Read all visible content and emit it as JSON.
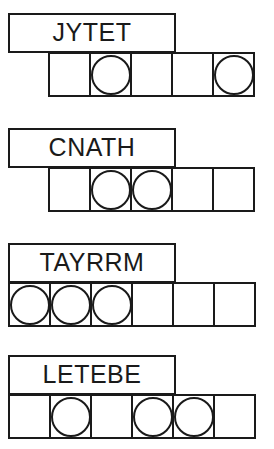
{
  "diagram": {
    "ink_color": "#1a1a1a",
    "paper_color": "#ffffff",
    "stroke_width_px": 2,
    "rows": [
      {
        "label": "JYTET",
        "letter_count": 5,
        "cell_count": 5,
        "strip_left_px": 48,
        "label_top_px": 13,
        "circles": [
          false,
          true,
          false,
          false,
          true
        ],
        "circle_count": 2,
        "circle_positions": [
          2,
          5
        ]
      },
      {
        "label": "CNATH",
        "letter_count": 5,
        "cell_count": 5,
        "strip_left_px": 48,
        "label_top_px": 128,
        "circles": [
          false,
          true,
          true,
          false,
          false
        ],
        "circle_count": 2,
        "circle_positions": [
          2,
          3
        ]
      },
      {
        "label": "TAYRRM",
        "letter_count": 6,
        "cell_count": 6,
        "strip_left_px": 8,
        "label_top_px": 243,
        "circles": [
          true,
          true,
          true,
          false,
          false,
          false
        ],
        "circle_count": 3,
        "circle_positions": [
          1,
          2,
          3
        ]
      },
      {
        "label": "LETEBE",
        "letter_count": 6,
        "cell_count": 6,
        "strip_left_px": 8,
        "label_top_px": 355,
        "circles": [
          false,
          true,
          false,
          true,
          true,
          false
        ],
        "circle_count": 3,
        "circle_positions": [
          2,
          4,
          5
        ]
      }
    ]
  }
}
